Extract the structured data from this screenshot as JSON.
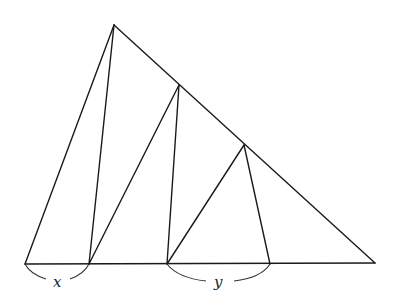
{
  "diagram": {
    "type": "geometry-figure",
    "stroke_color": "#1a1a1a",
    "points": {
      "A": [
        25,
        264
      ],
      "B": [
        375,
        263
      ],
      "P1": [
        114,
        25
      ],
      "P2": [
        179,
        85
      ],
      "P3": [
        244,
        145
      ],
      "Q1": [
        89,
        264
      ],
      "Q2": [
        167,
        264
      ],
      "Q3": [
        270,
        264
      ]
    },
    "segments": [
      [
        "A",
        "B"
      ],
      [
        "A",
        "P1"
      ],
      [
        "P1",
        "B"
      ],
      [
        "P1",
        "Q1"
      ],
      [
        "Q1",
        "P2"
      ],
      [
        "P2",
        "Q2"
      ],
      [
        "Q2",
        "P3"
      ],
      [
        "P3",
        "Q3"
      ]
    ],
    "labels": {
      "x": "x",
      "y": "y"
    },
    "braces": [
      {
        "label": "x",
        "from": "A",
        "to": "Q1"
      },
      {
        "label": "y",
        "from": "Q2",
        "to": "Q3"
      }
    ]
  }
}
